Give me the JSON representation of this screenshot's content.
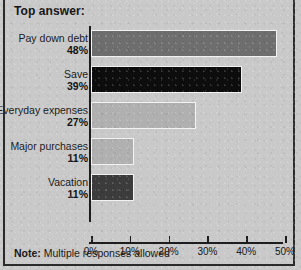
{
  "title": "Top answer:",
  "note": {
    "prefix": "Note:",
    "text": " Multiple responses allowed"
  },
  "colors": {
    "background": "#c9c9c9",
    "frame": "#2b2b2b",
    "axis": "#1d1d1d",
    "bar_border": "#f2f2f2"
  },
  "chart_data": {
    "type": "bar",
    "orientation": "horizontal",
    "title": "Top answer:",
    "xlabel": "",
    "ylabel": "",
    "xlim": [
      0,
      50
    ],
    "grid": false,
    "legend": null,
    "note": "Note: Multiple responses allowed",
    "categories": [
      "Pay down debt",
      "Save",
      "Everyday expenses",
      "Major purchases",
      "Vacation"
    ],
    "values": [
      48,
      39,
      27,
      11,
      11
    ],
    "value_labels": [
      "48%",
      "39%",
      "27%",
      "11%",
      "11%"
    ],
    "bar_colors": [
      "#6e6e6e",
      "#0d0d0d",
      "#b0b0b0",
      "#b0b0b0",
      "#3c3c3c"
    ],
    "xticks": [
      0,
      10,
      20,
      30,
      40,
      50
    ],
    "xticklabels": [
      "0%",
      "10%",
      "20%",
      "30%",
      "40%",
      "50%"
    ]
  }
}
